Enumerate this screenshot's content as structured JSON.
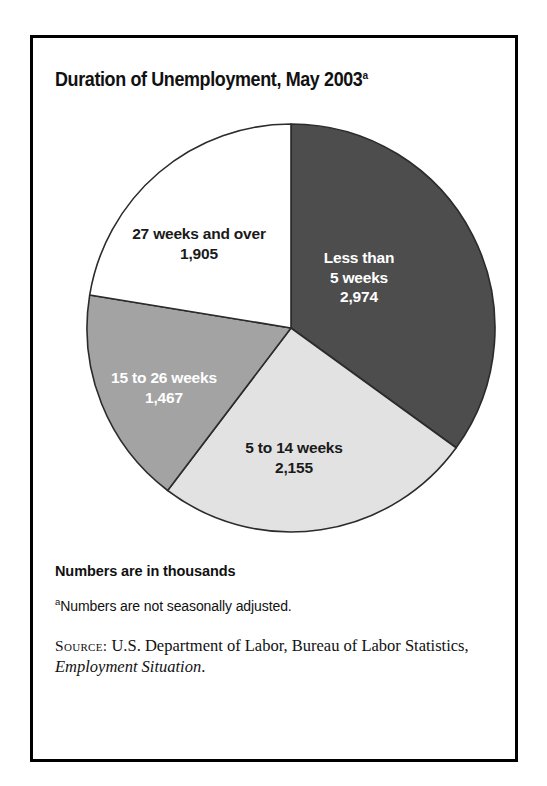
{
  "figure": {
    "title": "Duration of Unemployment, May 2003",
    "title_footnote_marker": "a",
    "border_color": "#000000",
    "background": "#ffffff"
  },
  "notes": {
    "units": "Numbers are in thousands",
    "footnote_marker": "a",
    "footnote_text": "Numbers are not seasonally adjusted.",
    "source_label": "Source:",
    "source_text_1": " U.S. Department of Labor, Bureau of Labor Statistics, ",
    "source_italic": "Employment Situation",
    "source_text_2": "."
  },
  "chart_data": {
    "type": "pie",
    "title": "Duration of Unemployment, May 2003",
    "units": "thousands",
    "total": 8501,
    "start_angle_deg": 0,
    "direction": "clockwise",
    "categories": [
      "Less than 5 weeks",
      "5 to 14 weeks",
      "15 to 26 weeks",
      "27 weeks and over"
    ],
    "values": [
      2974,
      2155,
      1467,
      1905
    ],
    "percentages": [
      34.98,
      25.35,
      17.26,
      22.41
    ],
    "slices": [
      {
        "label_line1": "Less than",
        "label_line2": "5 weeks",
        "value_text": "2,974",
        "value": 2974,
        "fill": "#4d4d4d",
        "text_color": "#ffffff",
        "angle_deg": 125.96
      },
      {
        "label_line1": "5 to 14 weeks",
        "label_line2": "",
        "value_text": "2,155",
        "value": 2155,
        "fill": "#e2e2e2",
        "text_color": "#1a1a1a",
        "angle_deg": 91.27
      },
      {
        "label_line1": "15 to 26 weeks",
        "label_line2": "",
        "value_text": "1,467",
        "value": 1467,
        "fill": "#a3a3a3",
        "text_color": "#ffffff",
        "angle_deg": 62.13
      },
      {
        "label_line1": "27 weeks and over",
        "label_line2": "",
        "value_text": "1,905",
        "value": 1905,
        "fill": "#ffffff",
        "text_color": "#1a1a1a",
        "angle_deg": 80.68
      }
    ],
    "legend": "none",
    "grid": false
  }
}
